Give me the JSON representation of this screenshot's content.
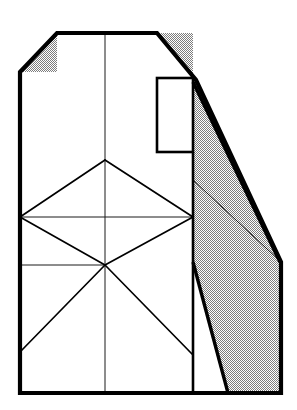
{
  "figure": {
    "kind": "technical-line-drawing",
    "title": "",
    "canvas": {
      "width": 297,
      "height": 410,
      "background": "#ffffff"
    },
    "colors": {
      "outline": "#000000",
      "hatch_fill": "#a8a8a8",
      "thin_line": "#1a1a1a",
      "paper": "#ffffff"
    },
    "stroke_widths": {
      "outline_heavy": 4.2,
      "outline_medium": 2.6,
      "construction_thin": 1.0
    },
    "shapes": {
      "body_outline": {
        "name": "main-body-outline",
        "points": "20,72 57,33 157,33 196,80 281,262 281,393 20,393"
      },
      "top_left_chamfer_face": {
        "name": "top-left-chamfer-face",
        "points": "20,72 57,33 57,72"
      },
      "top_right_chamfer_face": {
        "name": "top-right-chamfer-face",
        "points": "157,33 196,80 193,80 193,33"
      },
      "right_slope_face": {
        "name": "right-slope-shaded-face",
        "points": "193,80 196,80 281,262 193,262"
      },
      "right_lower_face": {
        "name": "right-lower-shaded-face",
        "points": "193,262 281,262 281,393 228,393"
      },
      "inner_rectangle": {
        "name": "inner-rectangle-notch",
        "x": 157,
        "y": 78,
        "width": 36,
        "height": 74
      }
    },
    "edges": {
      "left_edge": {
        "name": "left-edge",
        "x1": 20,
        "y1": 72,
        "x2": 20,
        "y2": 393
      },
      "bottom_edge": {
        "name": "bottom-edge",
        "x1": 20,
        "y1": 393,
        "x2": 281,
        "y2": 393
      },
      "top_edge": {
        "name": "top-edge",
        "x1": 57,
        "y1": 33,
        "x2": 157,
        "y2": 33
      },
      "right_edge": {
        "name": "right-edge",
        "x1": 281,
        "y1": 262,
        "x2": 281,
        "y2": 393
      },
      "top_left_chamfer": {
        "name": "top-left-chamfer-edge",
        "x1": 20,
        "y1": 72,
        "x2": 57,
        "y2": 33
      },
      "top_right_chamfer": {
        "name": "top-right-chamfer-edge",
        "x1": 157,
        "y1": 33,
        "x2": 196,
        "y2": 80
      },
      "right_long_slope_outer": {
        "name": "right-slope-outer-edge",
        "x1": 196,
        "y1": 80,
        "x2": 282,
        "y2": 263
      },
      "right_long_slope_inner": {
        "name": "right-slope-inner-edge",
        "x1": 193,
        "y1": 82,
        "x2": 280,
        "y2": 262
      },
      "lower_right_diagonal": {
        "name": "lower-right-diagonal-edge",
        "x1": 193,
        "y1": 262,
        "x2": 228,
        "y2": 393
      },
      "center_vertical": {
        "name": "center-vertical-construction-line",
        "x1": 105,
        "y1": 33,
        "x2": 105,
        "y2": 393
      },
      "inner_vertical_right": {
        "name": "right-inner-vertical-line",
        "x1": 193,
        "y1": 152,
        "x2": 193,
        "y2": 393
      },
      "mid_horizontal": {
        "name": "mid-horizontal-construction-line",
        "x1": 20,
        "y1": 217,
        "x2": 193,
        "y2": 217
      },
      "lower_horizontal": {
        "name": "lower-horizontal-construction-line",
        "x1": 20,
        "y1": 265,
        "x2": 105,
        "y2": 265
      },
      "thin_slope_to_apex": {
        "name": "thin-slope-to-right-apex",
        "x1": 193,
        "y1": 180,
        "x2": 281,
        "y2": 262
      }
    },
    "construction_lines": [
      {
        "name": "diamond-upper-left-edge",
        "x1": 105,
        "y1": 160,
        "x2": 20,
        "y2": 217
      },
      {
        "name": "diamond-upper-right-edge",
        "x1": 105,
        "y1": 160,
        "x2": 193,
        "y2": 217
      },
      {
        "name": "diamond-lower-left-edge",
        "x1": 20,
        "y1": 217,
        "x2": 105,
        "y2": 265
      },
      {
        "name": "diamond-lower-right-edge",
        "x1": 193,
        "y1": 217,
        "x2": 105,
        "y2": 265
      },
      {
        "name": "star-ray-down-left",
        "x1": 105,
        "y1": 265,
        "x2": 20,
        "y2": 352
      },
      {
        "name": "star-ray-down-right",
        "x1": 105,
        "y1": 265,
        "x2": 193,
        "y2": 355
      }
    ],
    "vertices": [
      {
        "name": "vertex-top-left-chamfer-low",
        "x": 20,
        "y": 72
      },
      {
        "name": "vertex-top-left-chamfer-high",
        "x": 57,
        "y": 33
      },
      {
        "name": "vertex-top-right",
        "x": 157,
        "y": 33
      },
      {
        "name": "vertex-slope-break",
        "x": 196,
        "y": 80
      },
      {
        "name": "vertex-right-apex",
        "x": 281,
        "y": 262
      },
      {
        "name": "vertex-bottom-right",
        "x": 281,
        "y": 393
      },
      {
        "name": "vertex-bottom-left",
        "x": 20,
        "y": 393
      },
      {
        "name": "vertex-diamond-top",
        "x": 105,
        "y": 160
      },
      {
        "name": "vertex-diamond-left",
        "x": 20,
        "y": 217
      },
      {
        "name": "vertex-diamond-right",
        "x": 193,
        "y": 217
      },
      {
        "name": "vertex-star-center",
        "x": 105,
        "y": 265
      }
    ],
    "labels": {
      "none_present": ""
    }
  }
}
